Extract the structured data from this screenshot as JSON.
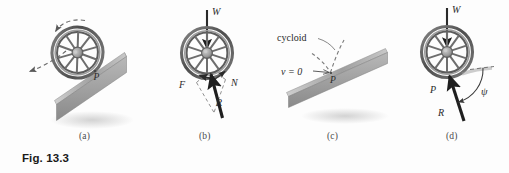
{
  "figure": {
    "caption": "Fig. 13.3",
    "panels": [
      {
        "key": "a",
        "label": "(a)",
        "labels": {
          "contact_point": "P"
        }
      },
      {
        "key": "b",
        "label": "(b)",
        "labels": {
          "weight": "W",
          "friction": "F",
          "normal": "N",
          "resultant": "R"
        }
      },
      {
        "key": "c",
        "label": "(c)",
        "labels": {
          "cycloid": "cycloid",
          "velocity": "v = 0",
          "contact_point": "P"
        }
      },
      {
        "key": "d",
        "label": "(d)",
        "labels": {
          "weight": "W",
          "contact_point": "P",
          "resultant": "R",
          "angle": "ψ"
        }
      }
    ],
    "colors": {
      "background": "#fdfdfd",
      "ink": "#2a2a2a",
      "incline_top": "#d8d8d8",
      "incline_face": "#8e8e8e",
      "wheel_rim": "#5a5a5a",
      "wheel_spoke": "#6e6e6e",
      "hub": "#9a9a9a",
      "dashed": "#6a6a6a",
      "caption": "#1a1a1a"
    }
  }
}
